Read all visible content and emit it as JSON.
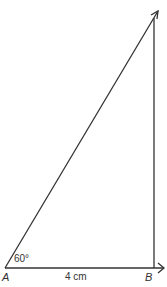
{
  "diagram": {
    "type": "geometric-construction",
    "points": [
      {
        "name": "A",
        "label": "A"
      },
      {
        "name": "B",
        "label": "B"
      }
    ],
    "segments": [
      {
        "from": "A",
        "to": "B",
        "label": "4 cm",
        "arrow_end": true
      },
      {
        "from": "A",
        "direction_deg": 60,
        "arrow_end": true
      },
      {
        "from": "B",
        "direction_deg": 90,
        "arrow_end": false
      }
    ],
    "angle": {
      "at": "A",
      "label": "60°"
    },
    "base_length": {
      "label": "4 cm"
    },
    "line_color": "#333333"
  }
}
